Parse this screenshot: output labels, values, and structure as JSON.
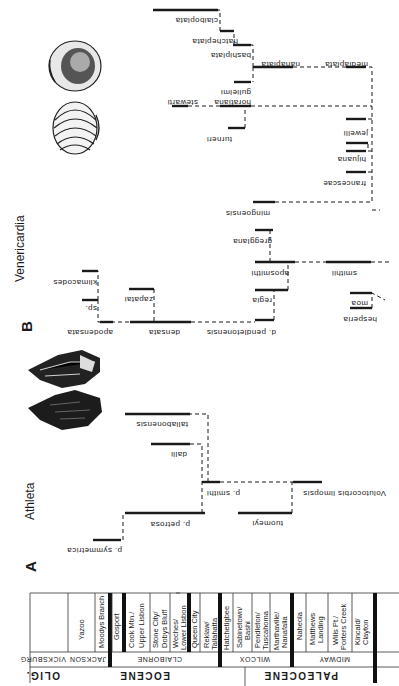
{
  "figure": {
    "panel_a": {
      "label": "A",
      "genus": "Athleta",
      "taxa": {
        "symmetrica": "p. symmetrica",
        "petrosa": "p. petrosa",
        "smithi": "p. smithi",
        "tuomeyi": "tuomeyi",
        "volutocorbis": "Volutocorbis limopsis",
        "dalli": "dalli",
        "tabonensis": "tallabonensis"
      }
    },
    "panel_b": {
      "label": "B",
      "genus": "Venericardia",
      "taxa": {
        "apodensata": "apodensata",
        "klimacodes": "klimacodes",
        "sp": "sp.",
        "densata": "densata",
        "zapatai": "zapatai",
        "pendletonensis": "d. pendletonensis",
        "regia": "regia",
        "aposmithi": "aposmithi",
        "gregglana": "gregglana",
        "smithii": "smithii",
        "hesperia": "hesperia",
        "moa": "moa",
        "mingoensis": "mingoensis",
        "francescae": "francescae",
        "hijuana": "hijuana",
        "jewelli": "jewelli",
        "turneri": "turneri",
        "horatiana": "horatiana",
        "stewarti": "stewarti",
        "nanaplata": "nanaplata",
        "mediaplata": "mediaplata",
        "gulielmi": "gulielmi",
        "bashiplata": "bashiplata",
        "hatchplata": "hatcheplata",
        "claiboplata": "claiboplata"
      }
    },
    "stratigraphy": {
      "epochs": [
        "OLIG.",
        "EOCENE",
        "PALEOCENE"
      ],
      "groups": [
        "VICKSBURG",
        "JACKSON",
        "CLAIBORNE",
        "WILCOX",
        "MIDWAY"
      ],
      "formations": [
        [
          "Yazoo"
        ],
        [
          "Moodys Branch"
        ],
        [
          "Gosport"
        ],
        [
          "Cook Mtn./",
          "Upper Lisbon"
        ],
        [
          "Stone City/",
          "Dobys Bluff"
        ],
        [
          "Weches/",
          "Lower Lisbon"
        ],
        [
          "Queen City"
        ],
        [
          "Reklaw/",
          "Tallahatta"
        ],
        [
          "Hatchetigbee"
        ],
        [
          "Sabinetown/",
          "Bashi"
        ],
        [
          "Pendleton/",
          "Tuscahoma"
        ],
        [
          "Marthaville/",
          "Nanafalia"
        ],
        [
          "Naheola"
        ],
        [
          "Matthews",
          "Landing"
        ],
        [
          "Wills Pt./",
          "Porters Creek"
        ],
        [
          "Kincaid/",
          "Clayton"
        ]
      ]
    }
  }
}
